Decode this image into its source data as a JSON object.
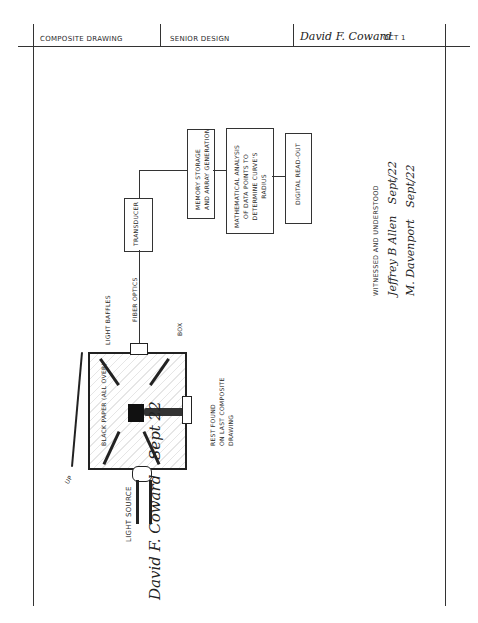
{
  "header": {
    "cells": [
      {
        "label": "COMPOSITE DRAWING"
      },
      {
        "label": "SENIOR DESIGN"
      },
      {
        "label": "David F. Coward",
        "date": "OCT 1"
      }
    ]
  },
  "diagram": {
    "blocks": [
      {
        "id": "transducer",
        "label": "TRANSDUCER"
      },
      {
        "id": "memory",
        "label": "MEMORY STORAGE AND ARRAY GENERATION"
      },
      {
        "id": "analysis",
        "label": "MATHEMATICAL ANALYSIS OF DATA POINTS TO DETERMINE CURVE'S RADIUS"
      },
      {
        "id": "readout",
        "label": "DIGITAL READ-OUT"
      }
    ],
    "labels": {
      "fiber_optics": "FIBER OPTICS",
      "light_baffles": "LIGHT BAFFLES",
      "box": "BOX",
      "black_paper": "BLACK PAPER (ALL OVER)",
      "rest_found": "REST FOUND ON LAST COMPOSITE DRAWING",
      "light_source": "LIGHT SOURCE",
      "up": "UP"
    }
  },
  "witness": {
    "heading": "WITNESSED AND UNDERSTOOD",
    "signatures": [
      {
        "name": "Jeffrey B Allen",
        "date": "Sept/22"
      },
      {
        "name": "M. Davenport",
        "date": "Sept/22"
      }
    ]
  },
  "author_signature": {
    "name": "David F. Coward",
    "date": "Sept 22"
  }
}
